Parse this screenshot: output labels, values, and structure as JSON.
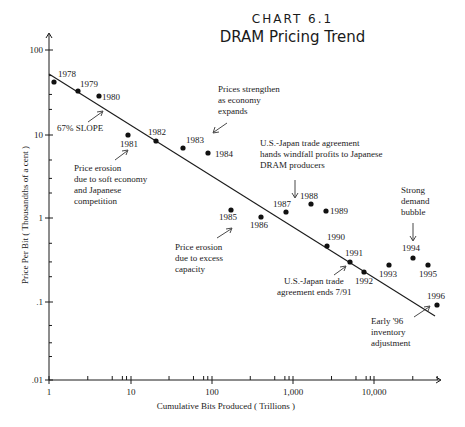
{
  "header": {
    "kicker": "CHART 6.1",
    "title": "DRAM Pricing Trend"
  },
  "chart_data": {
    "type": "scatter",
    "title": "DRAM Pricing Trend",
    "subtitle": "CHART 6.1",
    "xlabel": "Cumulative Bits Produced ( Trillions )",
    "ylabel": "Price Per Bit ( Thousandths of a cent )",
    "xscale": "log",
    "yscale": "log",
    "xlim": [
      1,
      60000
    ],
    "ylim": [
      0.01,
      100
    ],
    "x_ticks": [
      "1",
      "10",
      "100",
      "1,000",
      "10,000"
    ],
    "y_ticks": [
      "100",
      "10",
      "1",
      ".1",
      ".01"
    ],
    "grid": false,
    "series": [
      {
        "name": "DRAM price per bit",
        "points": [
          {
            "label": "1978",
            "x": 1.1,
            "y": 41
          },
          {
            "label": "1979",
            "x": 2.1,
            "y": 32
          },
          {
            "label": "1980",
            "x": 3.8,
            "y": 27
          },
          {
            "label": "1981",
            "x": 8.5,
            "y": 9.9
          },
          {
            "label": "1982",
            "x": 21,
            "y": 8.4
          },
          {
            "label": "1983",
            "x": 45,
            "y": 6.9
          },
          {
            "label": "1984",
            "x": 90,
            "y": 5.9
          },
          {
            "label": "1985",
            "x": 170,
            "y": 1.24
          },
          {
            "label": "1986",
            "x": 400,
            "y": 1.03
          },
          {
            "label": "1987",
            "x": 820,
            "y": 1.18
          },
          {
            "label": "1988",
            "x": 1650,
            "y": 1.47
          },
          {
            "label": "1989",
            "x": 2600,
            "y": 1.2
          },
          {
            "label": "1990",
            "x": 2700,
            "y": 0.46
          },
          {
            "label": "1991",
            "x": 4900,
            "y": 0.32
          },
          {
            "label": "1992",
            "x": 7400,
            "y": 0.24
          },
          {
            "label": "1993",
            "x": 15000,
            "y": 0.29
          },
          {
            "label": "1994",
            "x": 30000,
            "y": 0.36
          },
          {
            "label": "1995",
            "x": 45000,
            "y": 0.29
          },
          {
            "label": "1996",
            "x": 58000,
            "y": 0.1
          }
        ]
      },
      {
        "name": "67% SLOPE trend line",
        "type": "line",
        "points": [
          {
            "x": 1,
            "y": 52
          },
          {
            "x": 50000,
            "y": 0.065
          }
        ]
      }
    ],
    "annotations": [
      {
        "text": "67% SLOPE",
        "target": "trend line"
      },
      {
        "text": "Price erosion due to soft economy and Japanese competition",
        "target": "1981"
      },
      {
        "text": "Prices strengthen as economy expands",
        "target": "1983-1984"
      },
      {
        "text": "U.S.-Japan trade agreement hands windfall profits to Japanese DRAM producers",
        "target": "1988"
      },
      {
        "text": "Price erosion due to excess capacity",
        "target": "1985-1986"
      },
      {
        "text": "U.S.-Japan trade agreement ends 7/91",
        "target": "1991"
      },
      {
        "text": "Strong demand bubble",
        "target": "1994"
      },
      {
        "text": "Early '96 inventory adjustment",
        "target": "1996"
      }
    ]
  },
  "plot": {
    "axes": {
      "ylabel": "Price Per Bit ( Thousandths of a cent )",
      "xlabel": "Cumulative Bits Produced ( Trillions )",
      "y_ticks": [
        {
          "label": "100",
          "py": 50
        },
        {
          "label": "10",
          "py": 135
        },
        {
          "label": "1",
          "py": 218
        },
        {
          "label": ".1",
          "py": 302
        },
        {
          "label": ".01",
          "py": 380
        }
      ],
      "x_ticks": [
        {
          "label": "1",
          "px": 49
        },
        {
          "label": "10",
          "px": 131
        },
        {
          "label": "100",
          "px": 212
        },
        {
          "label": "1,000",
          "px": 293
        },
        {
          "label": "10,000",
          "px": 374
        }
      ]
    },
    "points": [
      {
        "label": "1978",
        "px": 54,
        "py": 82,
        "lx": 58,
        "ly": 77
      },
      {
        "label": "1979",
        "px": 78,
        "py": 91,
        "lx": 80,
        "ly": 87
      },
      {
        "label": "1980",
        "px": 99,
        "py": 96,
        "lx": 102,
        "ly": 100
      },
      {
        "label": "1981",
        "px": 128,
        "py": 135,
        "lx": 120,
        "ly": 147
      },
      {
        "label": "1982",
        "px": 156,
        "py": 141,
        "lx": 148,
        "ly": 135
      },
      {
        "label": "1983",
        "px": 183,
        "py": 148,
        "lx": 186,
        "ly": 143
      },
      {
        "label": "1984",
        "px": 208,
        "py": 153,
        "lx": 215,
        "ly": 157
      },
      {
        "label": "1985",
        "px": 231,
        "py": 210,
        "lx": 219,
        "ly": 220
      },
      {
        "label": "1986",
        "px": 261,
        "py": 217,
        "lx": 250,
        "ly": 228
      },
      {
        "label": "1987",
        "px": 286,
        "py": 212,
        "lx": 273,
        "ly": 207
      },
      {
        "label": "1988",
        "px": 311,
        "py": 204,
        "lx": 300,
        "ly": 199
      },
      {
        "label": "1989",
        "px": 326,
        "py": 211,
        "lx": 330,
        "ly": 214
      },
      {
        "label": "1990",
        "px": 327,
        "py": 246,
        "lx": 327,
        "ly": 240
      },
      {
        "label": "1991",
        "px": 350,
        "py": 262,
        "lx": 345,
        "ly": 256
      },
      {
        "label": "1992",
        "px": 364,
        "py": 272,
        "lx": 355,
        "ly": 284
      },
      {
        "label": "1993",
        "px": 389,
        "py": 265,
        "lx": 379,
        "ly": 277
      },
      {
        "label": "1994",
        "px": 413,
        "py": 258,
        "lx": 402,
        "ly": 251
      },
      {
        "label": "1995",
        "px": 428,
        "py": 265,
        "lx": 419,
        "ly": 277
      },
      {
        "label": "1996",
        "px": 437,
        "py": 305,
        "lx": 427,
        "ly": 299
      }
    ],
    "annotations": {
      "slope": "67% SLOPE",
      "soft_economy": [
        "Price erosion",
        "due to soft economy",
        "and Japanese",
        "competition"
      ],
      "strengthen": [
        "Prices strengthen",
        "as economy",
        "expands"
      ],
      "trade_windfall": [
        "U.S.-Japan trade agreement",
        "hands windfall profits to Japanese",
        "DRAM producers"
      ],
      "excess_capacity": [
        "Price erosion",
        "due to excess",
        "capacity"
      ],
      "trade_ends": [
        "U.S.-Japan trade",
        "agreement ends 7/91"
      ],
      "demand_bubble": [
        "Strong",
        "demand",
        "bubble"
      ],
      "inventory": [
        "Early '96",
        "inventory",
        "adjustment"
      ]
    }
  }
}
